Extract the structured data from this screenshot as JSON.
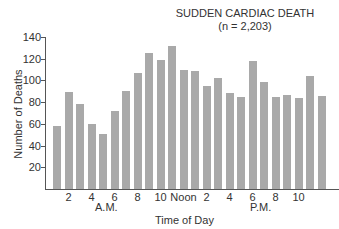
{
  "chart_data": {
    "type": "bar",
    "title": "SUDDEN CARDIAC DEATH",
    "subtitle": "(n = 2,203)",
    "xlabel": "Time of Day",
    "ylabel": "Number of Deaths",
    "ylim": [
      0,
      140
    ],
    "yticks": [
      20,
      40,
      60,
      80,
      100,
      120,
      140
    ],
    "xtick_labels": [
      "2",
      "4",
      "6",
      "8",
      "10",
      "Noon",
      "2",
      "4",
      "6",
      "8",
      "10"
    ],
    "period_labels": [
      "A.M.",
      "P.M."
    ],
    "grid": false,
    "categories": [
      "1",
      "2",
      "3",
      "4",
      "5",
      "6",
      "7",
      "8",
      "9",
      "10",
      "11",
      "12",
      "13",
      "14",
      "15",
      "16",
      "17",
      "18",
      "19",
      "20",
      "21",
      "22",
      "23",
      "24"
    ],
    "values": [
      58,
      89,
      78,
      60,
      51,
      72,
      90,
      107,
      125,
      119,
      132,
      110,
      109,
      95,
      102,
      88,
      85,
      118,
      99,
      85,
      87,
      84,
      104,
      86
    ],
    "bar_color": "#a9a9a9"
  }
}
